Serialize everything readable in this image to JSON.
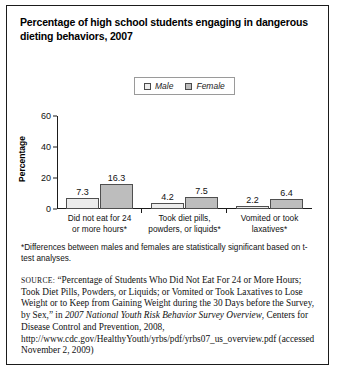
{
  "figure": {
    "title": "Percentage of high school students engaging in dangerous dieting behaviors, 2007"
  },
  "legend": {
    "position": "top-center",
    "items": [
      {
        "label": "Male",
        "swatch": "light-gray-square",
        "color": "#ececec"
      },
      {
        "label": "Female",
        "swatch": "medium-gray-square",
        "color": "#bdbdbd"
      }
    ]
  },
  "chart_data": {
    "type": "bar",
    "title": "Percentage of high school students engaging in dangerous dieting behaviors, 2007",
    "xlabel": "",
    "ylabel": "Percentage",
    "ylim": [
      0,
      60
    ],
    "yticks": [
      0,
      20,
      40,
      60
    ],
    "grid": false,
    "legend_position": "top-center",
    "categories": [
      "Did not eat for 24 or more hours*",
      "Took diet pills, powders, or liquids*",
      "Vomited or took laxatives*"
    ],
    "category_lines": [
      [
        "Did not eat for 24",
        "or more hours*"
      ],
      [
        "Took diet pills,",
        "powders, or liquids*"
      ],
      [
        "Vomited or took",
        "laxatives*"
      ]
    ],
    "series": [
      {
        "name": "Male",
        "color": "#ececec",
        "values": [
          7.3,
          4.2,
          2.2
        ]
      },
      {
        "name": "Female",
        "color": "#bdbdbd",
        "values": [
          16.3,
          7.5,
          6.4
        ]
      }
    ]
  },
  "notes": {
    "footnote": "*Differences between males and females are statistically significant based on t-test analyses.",
    "source_label": "SOURCE:",
    "source_part1": " “Percentage of Students Who Did Not Eat For 24 or More Hours; Took Diet Pills, Powders, or Liquids; or Vomited or Took Laxatives to Lose Weight or to Keep from Gaining Weight during the 30 Days before the Survey, by Sex,” in ",
    "source_italic": "2007 National Youth Risk Behavior Survey Overview",
    "source_part2": ", Centers for Disease Control and Prevention, 2008, http://www.cdc.gov/HealthyYouth/yrbs/pdf/yrbs07_us_overview.pdf (accessed November 2, 2009)"
  }
}
